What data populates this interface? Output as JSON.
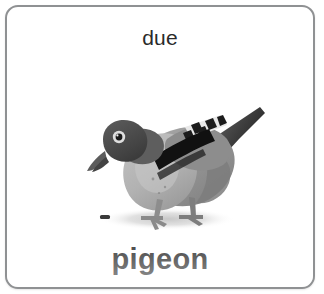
{
  "card": {
    "top_word": "due",
    "bottom_word": "pigeon",
    "border_color": "#8f9193",
    "background_color": "#ffffff",
    "text_color": "#2a2a2a"
  },
  "illustration": {
    "name": "pigeon-photo",
    "subject": "pigeon",
    "style": "grayscale photo cutout",
    "colors": {
      "head": "#4a4a4a",
      "breast": "#b4b4b4",
      "body": "#9a9a9a",
      "back": "#7d7d7d",
      "wing_bar": "#141414",
      "tail": "#3c3c3c",
      "beak": "#555555",
      "legs": "#8a8a8a",
      "shadow": "#d6d6d6",
      "seed": "#3a3a3a",
      "highlight": "#d8d8d8"
    },
    "parts": [
      "head",
      "eye",
      "beak",
      "neck",
      "breast",
      "body",
      "wing",
      "wing-bar",
      "checkered-wing-feathers",
      "tail",
      "legs",
      "feet",
      "ground-shadow",
      "seed-speck"
    ]
  }
}
